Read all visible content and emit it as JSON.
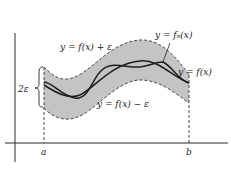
{
  "diagram": {
    "labels": {
      "upper_curve": "y = f(x) + ε",
      "lower_curve": "y = f(x) − ε",
      "fn_curve": "y = fₙ(x)",
      "f_curve": "y = f(x)",
      "band_width": "2ε",
      "x_left": "a",
      "x_right": "b"
    },
    "colors": {
      "band_fill": "#c4c4c4",
      "curve": "#1e1e1e",
      "axis": "#2a2a2a",
      "dashed": "#333333",
      "background": "#ffffff"
    }
  }
}
